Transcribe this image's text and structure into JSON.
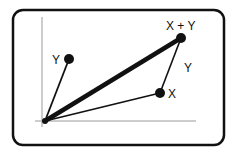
{
  "diagram": {
    "labels": {
      "y_point": "Y",
      "x_point": "X",
      "sum_point": "X + Y",
      "y_edge": "Y"
    },
    "points": {
      "origin": [
        45,
        121
      ],
      "y": [
        69,
        59
      ],
      "x": [
        160,
        93
      ],
      "sum": [
        181,
        38
      ]
    },
    "colors": {
      "stroke": "#111111",
      "axis": "#9a9a9a",
      "frame": "#111111"
    }
  }
}
